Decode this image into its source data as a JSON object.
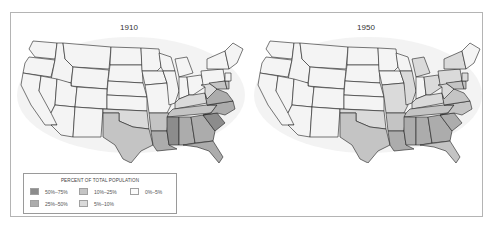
{
  "maps": [
    {
      "title": "1910",
      "shading": {
        "SC": "c50_75",
        "MS": "c50_75",
        "LA": "c25_50",
        "AL": "c25_50",
        "GA": "c25_50",
        "FL": "c25_50",
        "NC": "c25_50",
        "VA": "c25_50",
        "AR": "c10_25",
        "TN": "c10_25",
        "TX": "c10_25",
        "KY": "c5_10",
        "OK": "c5_10",
        "WV": "c5_10",
        "MD": "c10_25",
        "DE": "c10_25"
      }
    },
    {
      "title": "1950",
      "shading": {
        "MS": "c25_50",
        "SC": "c25_50",
        "LA": "c25_50",
        "AL": "c25_50",
        "GA": "c25_50",
        "NC": "c10_25",
        "VA": "c10_25",
        "AR": "c10_25",
        "TN": "c10_25",
        "TX": "c10_25",
        "FL": "c10_25",
        "MD": "c10_25",
        "DE": "c10_25",
        "KY": "c5_10",
        "OK": "c5_10",
        "MO": "c5_10",
        "IL": "c5_10",
        "MI": "c5_10",
        "OH": "c5_10",
        "PA": "c5_10",
        "NJ": "c5_10",
        "NY": "c5_10",
        "WV": "c5_10"
      }
    }
  ],
  "legend": {
    "title": "Percent of Total Population",
    "items": [
      {
        "key": "c50_75",
        "label": "50%–75%",
        "color": "#8c8c8c"
      },
      {
        "key": "c10_25",
        "label": "10%–25%",
        "color": "#c4c4c4"
      },
      {
        "key": "c0_5",
        "label": "0%–5%",
        "color": "#fbfbfb"
      },
      {
        "key": "c25_50",
        "label": "25%–50%",
        "color": "#acacac"
      },
      {
        "key": "c5_10",
        "label": "5%–10%",
        "color": "#dadada"
      }
    ]
  },
  "colors": {
    "default_fill": "#f4f4f4",
    "land_halo": "#e8e8e8",
    "border": "#1e1e1e",
    "frame": "#b4b4b4"
  }
}
